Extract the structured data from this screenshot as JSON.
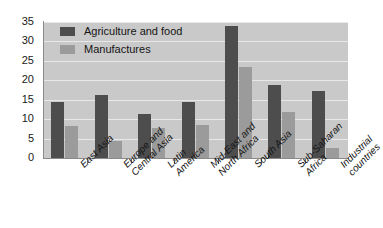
{
  "chart_data": {
    "type": "bar",
    "title": "",
    "xlabel": "",
    "ylabel": "",
    "ylim": [
      0,
      35
    ],
    "yticks": [
      "0",
      "5",
      "10",
      "15",
      "20",
      "25",
      "30",
      "35"
    ],
    "grid": true,
    "legend_position": "top-left",
    "categories": [
      "East Asia",
      "Europe and Central Asia",
      "Latin America",
      "Mid-East and North Africa",
      "South Asia",
      "Sub-Saharan Africa",
      "Industrial countries"
    ],
    "category_lines": [
      [
        "East Asia"
      ],
      [
        "Europe and",
        "Central Asia"
      ],
      [
        "Latin",
        "America"
      ],
      [
        "Mid-East and",
        "North Africa"
      ],
      [
        "South Asia"
      ],
      [
        "Sub-Saharan",
        "Africa"
      ],
      [
        "Industrial",
        "countries"
      ]
    ],
    "series": [
      {
        "name": "Agriculture and food",
        "color": "#4d4d4d",
        "values": [
          14.3,
          16.3,
          11.2,
          14.4,
          34.0,
          18.7,
          17.3
        ]
      },
      {
        "name": "Manufactures",
        "color": "#9b9b9b",
        "values": [
          8.2,
          4.5,
          7.6,
          8.6,
          23.5,
          11.8,
          2.5
        ]
      }
    ]
  },
  "colors": {
    "plot_background": "#c9c9c9",
    "gridline": "#e8e8e8",
    "axis": "#8a8a8a",
    "page_background": "#ffffff",
    "text": "#141414"
  }
}
